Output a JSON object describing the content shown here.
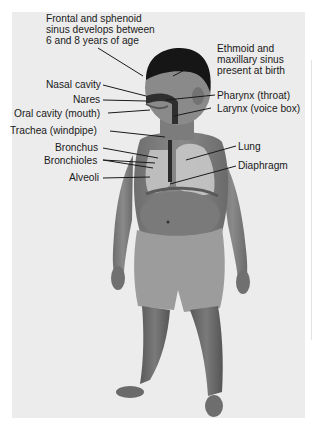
{
  "figure": {
    "type": "anatomical-diagram",
    "background_color": "#ececec",
    "labels": {
      "frontal_sinus": [
        "Frontal and sphenoid",
        "sinus develops between",
        "6 and 8 years of age"
      ],
      "ethmoid_sinus": [
        "Ethmoid and",
        "maxillary sinus",
        "present at birth"
      ],
      "nasal_cavity": "Nasal cavity",
      "nares": "Nares",
      "oral_cavity": "Oral cavity (mouth)",
      "pharynx": "Pharynx (throat)",
      "larynx": "Larynx (voice box)",
      "trachea": "Trachea (windpipe)",
      "bronchus": "Bronchus",
      "bronchioles": "Bronchioles",
      "alveoli": "Alveoli",
      "lung": "Lung",
      "diaphragm": "Diaphragm"
    }
  }
}
